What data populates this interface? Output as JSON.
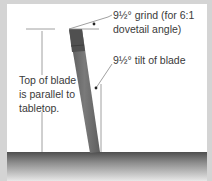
{
  "diagram": {
    "labels": {
      "grind_line1": "9½° grind (for 6:1",
      "grind_line2": "dovetail angle)",
      "tilt": "9½° tilt of blade",
      "parallel_line1": "Top of blade",
      "parallel_line2": "is parallel to",
      "parallel_line3": "tabletop."
    },
    "colors": {
      "background": "#d4d4d4",
      "panel": "#ffffff",
      "blade": "#6b6b6b",
      "blade_top": "#555555",
      "tabletop_dark": "#555555",
      "tabletop_light": "#e6e6e6",
      "leader_line": "#777777",
      "text": "#3a3a3a"
    }
  }
}
